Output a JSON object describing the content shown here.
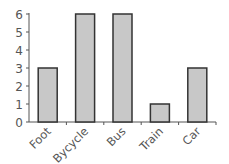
{
  "chart_data": {
    "type": "bar",
    "title": "",
    "xlabel": "",
    "ylabel": "",
    "categories": [
      "Foot",
      "Bycycle",
      "Bus",
      "Train",
      "Car"
    ],
    "values": [
      3,
      6,
      6,
      1,
      3
    ],
    "ylim": [
      0,
      6
    ],
    "yticks": [
      0,
      1,
      2,
      3,
      4,
      5,
      6
    ],
    "grid": false,
    "legend": null,
    "bar_color": "#c8c8c8",
    "bar_edge_color": "#333333",
    "axis_color": "#555555"
  }
}
